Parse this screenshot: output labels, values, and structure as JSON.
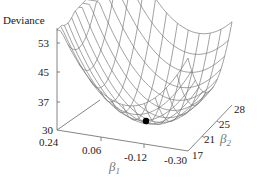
{
  "chart_data": {
    "type": "surface3d",
    "title": "",
    "zlabel": "Deviance",
    "xlabel": "β1",
    "ylabel": "β2",
    "z_ticks": [
      "53",
      "45",
      "37",
      "30"
    ],
    "x_ticks": [
      "0.24",
      "0.06",
      "-0.12",
      "-0.30"
    ],
    "y_ticks": [
      "17",
      "21",
      "25",
      "28"
    ],
    "zlim": [
      30,
      56
    ],
    "xlim": [
      0.24,
      -0.3
    ],
    "ylim": [
      17,
      28
    ],
    "minimum_marker": {
      "beta1": -0.08,
      "beta2": 21.5,
      "deviance": 30.5,
      "color": "#000000"
    },
    "surface": "quadratic bowl of deviance over (beta1, beta2) drawn as wireframe mesh"
  },
  "labels": {
    "zlabel": "Deviance",
    "beta": "β",
    "sub1": "1",
    "sub2": "2",
    "z": [
      "53",
      "45",
      "37",
      "30"
    ],
    "x": [
      "0.24",
      "0.06",
      "-0.12",
      "-0.30"
    ],
    "y": [
      "17",
      "21",
      "25",
      "28"
    ]
  }
}
